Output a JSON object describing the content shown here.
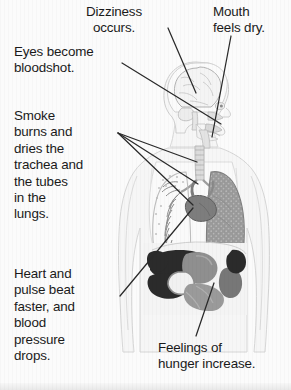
{
  "figure": {
    "kind": "anatomical-diagram",
    "view": "head-in-right-facing-profile-with-frontal-torso",
    "palette": {
      "page_background": "#fbfbfb",
      "body_outline": "#d3d3d3",
      "body_fill": "#f6f6f6",
      "brain_fill": "#f4f4f4",
      "brain_outline": "#b9b9b9",
      "airway_fill": "#e3e3e3",
      "trachea_fill": "#dcdcdc",
      "lung_left_fill": "#f2f2f2",
      "lung_right_fill": "#9a9a9a",
      "bronchi_line": "#8e8e8e",
      "heart_fill": "#7d7d7d",
      "liver_fill": "#2b2b2b",
      "stomach_fill": "#8f8f8f",
      "intestine_fill": "#9a9a9a",
      "kidney_fill": "#777777",
      "leader_line": "#2a2a2a",
      "text": "#1a1a1a"
    }
  },
  "captions": [
    {
      "id": "dizziness",
      "text": "Dizziness\noccurs.",
      "align": "center",
      "points_to": "brain"
    },
    {
      "id": "mouth",
      "text": "Mouth\nfeels dry.",
      "align": "left",
      "points_to": "mouth"
    },
    {
      "id": "eyes",
      "text": "Eyes become\nbloodshot.",
      "align": "left",
      "points_to": "eye"
    },
    {
      "id": "smoke",
      "text": "Smoke\nburns and\ndries the\ntrachea and\nthe tubes\nin the\nlungs.",
      "align": "left",
      "points_to": "trachea-and-bronchi"
    },
    {
      "id": "heart",
      "text": "Heart and\npulse beat\nfaster, and\nblood\npressure\ndrops.",
      "align": "left",
      "points_to": "heart"
    },
    {
      "id": "hunger",
      "text": "Feelings of\nhunger increase.",
      "align": "left",
      "points_to": "stomach"
    }
  ],
  "leader_lines": [
    {
      "id": "leader-dizziness",
      "from": [
        168,
        28
      ],
      "to": [
        196,
        93
      ]
    },
    {
      "id": "leader-eyes",
      "from": [
        122,
        63
      ],
      "to": [
        221,
        124
      ]
    },
    {
      "id": "leader-mouth",
      "from": [
        231,
        36
      ],
      "to": [
        212,
        137
      ]
    },
    {
      "id": "leader-smoke-1",
      "from": [
        118,
        133
      ],
      "to": [
        197,
        162
      ]
    },
    {
      "id": "leader-smoke-2",
      "from": [
        118,
        133
      ],
      "to": [
        198,
        184
      ]
    },
    {
      "id": "leader-smoke-3",
      "from": [
        118,
        133
      ],
      "to": [
        193,
        205
      ]
    },
    {
      "id": "leader-heart",
      "from": [
        120,
        296
      ],
      "to": [
        193,
        208
      ]
    },
    {
      "id": "leader-hunger",
      "from": [
        196,
        336
      ],
      "to": [
        214,
        283
      ]
    }
  ]
}
